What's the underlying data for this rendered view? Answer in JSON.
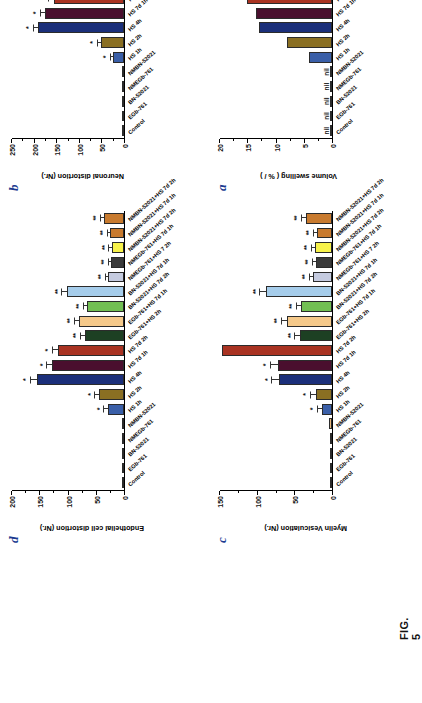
{
  "figure": {
    "caption": "FIG. 5",
    "categories": [
      "Control",
      "EGb-761",
      "BN-52021",
      "NMEGb-761",
      "NMBN-52021",
      "HS 1h",
      "HS 2h",
      "HS 4h",
      "HS 7d 1h",
      "HS 7d 2h",
      "EGb-761+HS 2h",
      "EGb-761+HS 7d 1h",
      "BN-52021+HS 7d 2h",
      "BN-52021+HS 7d 1h",
      "NMEGb-761+HS 7 2h",
      "NMEGb-761+HS 7d 1h",
      "NMBN-52021+HS 7d 2h",
      "NMBN-52021+HS 7d 1h",
      "NMBN-52021+HS 7d 2h"
    ],
    "colors": [
      "#d9d2c4",
      "#c7c7c7",
      "#b8c9a8",
      "#cfcfcf",
      "#e8b87c",
      "#3a5fa8",
      "#8a6f22",
      "#1b2f7a",
      "#4a0f2e",
      "#a93322",
      "#1d4023",
      "#f5c98a",
      "#72bf53",
      "#a6cdeb",
      "#c5cbe0",
      "#3a3a3a",
      "#f7f24a",
      "#c87a2e",
      "#c87a2e"
    ]
  },
  "chart_data": [
    {
      "type": "bar",
      "panel": "a",
      "title": "",
      "ylabel": "Volume swelling ( % / )",
      "xlabel": "",
      "ylim": [
        0,
        20
      ],
      "yticks": [
        0,
        5,
        10,
        15,
        20
      ],
      "grid": false,
      "legend": "none",
      "categories": [
        "Control",
        "EGb-761",
        "BN-52021",
        "NMEGb-761",
        "NMBN-52021",
        "HS 1h",
        "HS 2h",
        "HS 4h",
        "HS 7d 1h",
        "HS 7d 2h",
        "EGb-761+HS 2h",
        "EGb-761+HS 7d 1h",
        "BN-52021+HS 7d 2h",
        "BN-52021+HS 7d 1h",
        "NMEGb-761+HS 7 2h",
        "NMEGb-761+HS 7d 1h",
        "NMBN-52021+HS 7d 2h",
        "NMBN-52021+HS 7d 1h",
        "NMBN-52021+HS 7d 2h"
      ],
      "values": [
        0,
        0,
        0,
        0,
        0,
        4.1,
        8.0,
        13.0,
        13.6,
        15.2,
        2.4,
        4.6,
        2.1,
        3.0,
        2.9,
        2.2,
        2.6,
        2.0,
        3.6
      ],
      "errors": [
        0,
        0,
        0,
        0,
        0,
        0,
        0,
        0,
        0,
        0,
        0,
        0,
        0,
        0,
        0,
        0,
        0,
        0,
        0
      ],
      "significance": [
        "",
        "",
        "",
        "",
        "",
        "",
        "",
        "",
        "",
        "",
        "",
        "",
        "",
        "",
        "",
        "",
        "",
        "",
        ""
      ],
      "annotations": [
        "nil",
        "nil",
        "nil",
        "nil",
        "nil",
        "",
        "",
        "",
        "",
        "",
        "",
        "",
        "",
        "",
        "",
        "",
        "",
        "",
        ""
      ]
    },
    {
      "type": "bar",
      "panel": "b",
      "title": "",
      "ylabel": "Neuronal distortion (Nr.)",
      "xlabel": "",
      "ylim": [
        0,
        250
      ],
      "yticks": [
        0,
        50,
        100,
        150,
        200,
        250
      ],
      "grid": false,
      "legend": "none",
      "categories": [
        "Control",
        "EGb-761",
        "BN-52021",
        "NMEGb-761",
        "NMBN-52021",
        "HS 1h",
        "HS 2h",
        "HS 4h",
        "HS 7d 1h",
        "HS 7d 2h",
        "EGb-761+HS 2h",
        "EGb-761+HS 7d 1h",
        "BN-52021+HS 7d 2h",
        "BN-52021+HS 7d 1h",
        "NMEGb-761+HS 7 2h",
        "NMEGb-761+HS 7d 1h",
        "NMBN-52021+HS 7d 2h",
        "NMBN-52021+HS 7d 1h",
        "NMBN-52021+HS 7d 2h"
      ],
      "values": [
        2,
        0,
        0,
        0,
        4,
        24,
        52,
        192,
        176,
        156,
        66,
        60,
        66,
        86,
        30,
        24,
        26,
        30,
        48
      ],
      "errors": [
        0,
        0,
        0,
        0,
        0,
        6,
        7,
        10,
        9,
        12,
        6,
        6,
        7,
        8,
        5,
        4,
        4,
        5,
        6
      ],
      "significance": [
        "",
        "",
        "",
        "",
        "",
        "*",
        "*",
        "*",
        "*",
        "*",
        "**",
        "**",
        "**",
        "**",
        "**",
        "**",
        "**",
        "**",
        "**"
      ],
      "annotations": [
        "",
        "",
        "",
        "",
        "",
        "",
        "",
        "",
        "",
        "",
        "",
        "",
        "",
        "",
        "",
        "",
        "",
        "",
        ""
      ]
    },
    {
      "type": "bar",
      "panel": "c",
      "title": "",
      "ylabel": "Myelin Vesiculation (Nr.)",
      "xlabel": "",
      "ylim": [
        0,
        150
      ],
      "yticks": [
        0,
        50,
        100,
        150
      ],
      "grid": false,
      "legend": "none",
      "categories": [
        "Control",
        "EGb-761",
        "BN-52021",
        "NMEGb-761",
        "NMBN-52021",
        "HS 1h",
        "HS 2h",
        "HS 4h",
        "HS 7d 1h",
        "HS 7d 2h",
        "EGb-761+HS 2h",
        "EGb-761+HS 7d 1h",
        "BN-52021+HS 7d 2h",
        "BN-52021+HS 7d 1h",
        "NMEGb-761+HS 7 2h",
        "NMEGb-761+HS 7d 1h",
        "NMBN-52021+HS 7d 2h",
        "NMBN-52021+HS 7d 1h",
        "NMBN-52021+HS 7d 2h"
      ],
      "values": [
        3,
        1,
        1,
        1,
        4,
        14,
        22,
        71,
        73,
        148,
        43,
        60,
        41,
        88,
        26,
        22,
        23,
        20,
        35
      ],
      "errors": [
        0,
        0,
        0,
        0,
        0,
        5,
        6,
        9,
        9,
        0,
        6,
        7,
        6,
        8,
        4,
        4,
        4,
        4,
        5
      ],
      "significance": [
        "",
        "",
        "",
        "",
        "",
        "*",
        "*",
        "*",
        "*",
        "",
        "**",
        "**",
        "**",
        "**",
        "**",
        "**",
        "**",
        "**",
        "**"
      ],
      "annotations": [
        "",
        "",
        "",
        "",
        "",
        "",
        "",
        "",
        "",
        "",
        "",
        "",
        "",
        "",
        "",
        "",
        "",
        "",
        ""
      ]
    },
    {
      "type": "bar",
      "panel": "d",
      "title": "",
      "ylabel": "Endothelial cell distortion (Nr.)",
      "xlabel": "",
      "ylim": [
        0,
        200
      ],
      "yticks": [
        0,
        50,
        100,
        150,
        200
      ],
      "grid": false,
      "legend": "none",
      "categories": [
        "Control",
        "EGb-761",
        "BN-52021",
        "NMEGb-761",
        "NMBN-52021",
        "HS 1h",
        "HS 2h",
        "HS 4h",
        "HS 7d 1h",
        "HS 7d 2h",
        "EGb-761+HS 2h",
        "EGb-761+HS 7d 1h",
        "BN-52021+HS 7d 2h",
        "BN-52021+HS 7d 1h",
        "NMEGb-761+HS 7 2h",
        "NMEGb-761+HS 7d 1h",
        "NMBN-52021+HS 7d 2h",
        "NMBN-52021+HS 7d 1h",
        "NMBN-52021+HS 7d 2h"
      ],
      "values": [
        2,
        0,
        0,
        0,
        3,
        29,
        44,
        156,
        128,
        118,
        70,
        81,
        66,
        102,
        28,
        23,
        22,
        25,
        36
      ],
      "errors": [
        0,
        0,
        0,
        0,
        0,
        6,
        7,
        10,
        9,
        9,
        7,
        7,
        6,
        8,
        4,
        4,
        4,
        4,
        5
      ],
      "significance": [
        "",
        "",
        "",
        "",
        "",
        "*",
        "*",
        "*",
        "*",
        "*",
        "**",
        "**",
        "**",
        "**",
        "**",
        "**",
        "**",
        "**",
        "**"
      ],
      "annotations": [
        "",
        "",
        "",
        "",
        "",
        "",
        "",
        "",
        "",
        "",
        "",
        "",
        "",
        "",
        "",
        "",
        "",
        "",
        ""
      ]
    }
  ]
}
